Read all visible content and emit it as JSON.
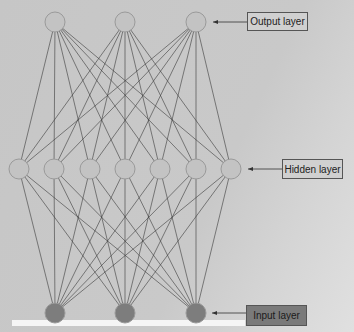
{
  "diagram": {
    "colors": {
      "background": "#c9c9c9",
      "node_fill": "#c3c3c3",
      "node_stroke": "#9a9a9a",
      "input_fill": "#7d7d7d",
      "edge": "#3a3a3a",
      "input_label_fill": "#7a7a7a",
      "label_fill": "#d0d0d0"
    },
    "layers": [
      {
        "name": "output",
        "label": "Output layer",
        "y": 22,
        "nodes_x": [
          55,
          125,
          196
        ]
      },
      {
        "name": "hidden",
        "label": "Hidden layer",
        "y": 169,
        "nodes_x": [
          19,
          54,
          90,
          125,
          160,
          196,
          231
        ]
      },
      {
        "name": "input",
        "label": "Input layer",
        "y": 313,
        "nodes_x": [
          55,
          125,
          196
        ]
      }
    ],
    "labels": {
      "output": "Output layer",
      "hidden": "Hidden layer",
      "input": "Input layer"
    }
  }
}
